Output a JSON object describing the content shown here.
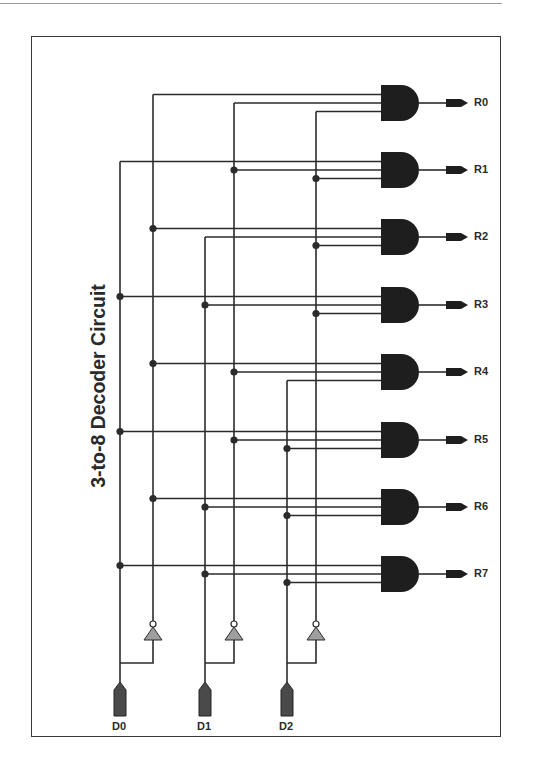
{
  "title": "3-to-8 Decoder Circuit",
  "inputs": [
    {
      "label": "D0",
      "x": 120,
      "inv_x": 153
    },
    {
      "label": "D1",
      "x": 205,
      "inv_x": 234
    },
    {
      "label": "D2",
      "x": 287,
      "inv_x": 316
    }
  ],
  "outputs": [
    {
      "label": "R0",
      "inputs": [
        "D0'",
        "D1'",
        "D2'"
      ]
    },
    {
      "label": "R1",
      "inputs": [
        "D0",
        "D1'",
        "D2'"
      ]
    },
    {
      "label": "R2",
      "inputs": [
        "D0'",
        "D1",
        "D2'"
      ]
    },
    {
      "label": "R3",
      "inputs": [
        "D0",
        "D1",
        "D2'"
      ]
    },
    {
      "label": "R4",
      "inputs": [
        "D0'",
        "D1'",
        "D2"
      ]
    },
    {
      "label": "R5",
      "inputs": [
        "D0",
        "D1'",
        "D2"
      ]
    },
    {
      "label": "R6",
      "inputs": [
        "D0'",
        "D1",
        "D2"
      ]
    },
    {
      "label": "R7",
      "inputs": [
        "D0",
        "D1",
        "D2"
      ]
    }
  ],
  "colors": {
    "wire": "#2b2b2b",
    "gate": "#1e1e1e",
    "inverter": "#9e9e9e",
    "pin": "#4a4a4a",
    "text": "#2a2a2a"
  }
}
